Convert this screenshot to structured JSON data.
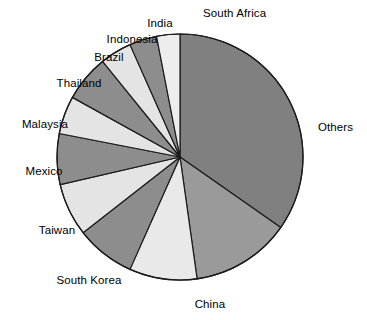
{
  "chart_data": {
    "type": "pie",
    "title": "",
    "subtitle": "",
    "xlabel": "",
    "ylabel": "",
    "legend_position": "none",
    "grid": false,
    "label_style": "outside-callout",
    "start_angle_deg": 0,
    "direction": "clockwise",
    "categories": [
      "Others",
      "China",
      "South Korea",
      "Taiwan",
      "Mexico",
      "Malaysia",
      "Thailand",
      "Brazil",
      "Indonesia",
      "India",
      "South Africa"
    ],
    "values": [
      34.7,
      13.1,
      8.9,
      7.8,
      6.9,
      6.7,
      5.0,
      6.1,
      4.2,
      3.6,
      3.0
    ],
    "units": "percent",
    "slices": [
      {
        "label": "Others",
        "value": 34.7,
        "angle_deg": 125.0,
        "color": "#808080"
      },
      {
        "label": "China",
        "value": 13.1,
        "angle_deg": 47.0,
        "color": "#9a9a9a"
      },
      {
        "label": "South Korea",
        "value": 8.9,
        "angle_deg": 32.0,
        "color": "#e9e9e9"
      },
      {
        "label": "Taiwan",
        "value": 7.8,
        "angle_deg": 28.0,
        "color": "#8d8d8d"
      },
      {
        "label": "Mexico",
        "value": 6.9,
        "angle_deg": 25.0,
        "color": "#e4e4e4"
      },
      {
        "label": "Malaysia",
        "value": 6.7,
        "angle_deg": 24.0,
        "color": "#8d8d8d"
      },
      {
        "label": "Thailand",
        "value": 5.0,
        "angle_deg": 18.0,
        "color": "#e4e4e4"
      },
      {
        "label": "Brazil",
        "value": 6.1,
        "angle_deg": 22.0,
        "color": "#8d8d8d"
      },
      {
        "label": "Indonesia",
        "value": 4.2,
        "angle_deg": 15.0,
        "color": "#e4e4e4"
      },
      {
        "label": "India",
        "value": 3.6,
        "angle_deg": 13.0,
        "color": "#8d8d8d"
      },
      {
        "label": "South Africa",
        "value": 3.0,
        "angle_deg": 11.0,
        "color": "#ededed"
      }
    ],
    "geometry": {
      "center_x": 180,
      "center_y": 157,
      "radius": 123,
      "stroke_color": "#1b1b1b",
      "stroke_width": 1.2,
      "background": "#ffffff"
    }
  },
  "labels": {
    "others": "Others",
    "china": "China",
    "south_korea": "South Korea",
    "taiwan": "Taiwan",
    "mexico": "Mexico",
    "malaysia": "Malaysia",
    "thailand": "Thailand",
    "brazil": "Brazil",
    "indonesia": "Indonesia",
    "india": "India",
    "south_africa": "South Africa"
  },
  "label_positions": [
    {
      "key": "south_africa",
      "x": 203,
      "y": 14,
      "align": "left"
    },
    {
      "key": "india",
      "x": 160,
      "y": 24,
      "align": "mid"
    },
    {
      "key": "indonesia",
      "x": 132,
      "y": 40,
      "align": "mid"
    },
    {
      "key": "brazil",
      "x": 109,
      "y": 58,
      "align": "mid"
    },
    {
      "key": "thailand",
      "x": 79,
      "y": 84,
      "align": "mid"
    },
    {
      "key": "malaysia",
      "x": 45,
      "y": 125,
      "align": "mid"
    },
    {
      "key": "mexico",
      "x": 44,
      "y": 172,
      "align": "mid"
    },
    {
      "key": "taiwan",
      "x": 57,
      "y": 231,
      "align": "mid"
    },
    {
      "key": "south_korea",
      "x": 89,
      "y": 281,
      "align": "mid"
    },
    {
      "key": "china",
      "x": 210,
      "y": 305,
      "align": "mid"
    },
    {
      "key": "others",
      "x": 318,
      "y": 128,
      "align": "left"
    }
  ]
}
